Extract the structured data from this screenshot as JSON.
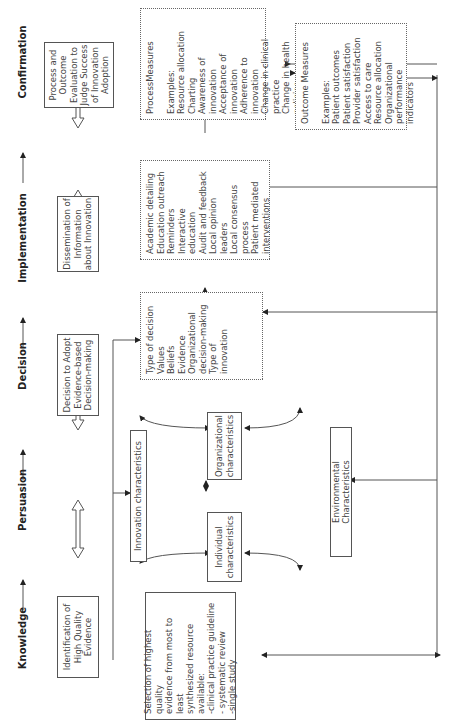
{
  "stages": [
    {
      "label": "Knowledge"
    },
    {
      "label": "Persuasion"
    },
    {
      "label": "Decision"
    },
    {
      "label": "Implementation"
    },
    {
      "label": "Confirmation"
    }
  ],
  "top_boxes": {
    "knowledge": "Identification of\nHigh Quality\nEvidence",
    "decision": "Decision to Adopt\nEvidence-based\nDecision-making",
    "implementation": "Dissemination of\nInformation\nabout Innovation",
    "confirmation": "Process and\nOutcome\nEvaluation to\nJudge Success\nof Innovation\nAdoption"
  },
  "evidence_selection": {
    "text": "Selection of highest quality\nevidence from most to least\nsynthesized resource\navailable:\n-clinical practice guideline\n- systematic review\n-single study"
  },
  "persuasion_factors": {
    "innovation": "Innovation characteristics",
    "organizational": "Organizational\ncharacteristics",
    "individual": "Individual\ncharacteristics",
    "environmental": "Environmental Characteristics"
  },
  "decision_factors": {
    "items": "Type of decision\nValues\nBeliefs\nEvidence\nOrganizational\ndecision-making\nType of innovation"
  },
  "implementation_strategies": {
    "items": "Academic detailing\nEducation outreach\nReminders\nInteractive education\nAudit and feedback\nLocal opinion leaders\nLocal consensus\nprocess\nPatient mediated\ninterventions"
  },
  "process_measures": {
    "title": "ProcessMeasures",
    "items": "Examples:\nResource allocation\nCharting\nAwareness of innovation\nAcceptance of innovation\nAdherence to innovation\nChange in clinical practice\nChange in health policies"
  },
  "outcome_measures": {
    "title": "Outcome Measures",
    "items": "Examples:\nPatient outcomes\nPatient satisfaction\nProvider satisfaction\nAccess to care\nResource allocation\nOrganizational\nperformance indicators"
  }
}
